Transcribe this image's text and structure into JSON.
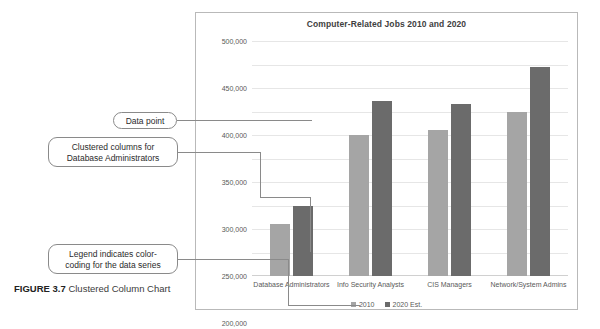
{
  "figure": {
    "caption_label": "FIGURE 3.7",
    "caption_text": "Clustered Column Chart"
  },
  "callouts": [
    {
      "id": "data-point",
      "text": "Data point"
    },
    {
      "id": "clustered-columns",
      "text": "Clustered columns for Database Administrators"
    },
    {
      "id": "legend-note",
      "text": "Legend indicates color-coding for the data series"
    }
  ],
  "colors": {
    "series_2010": "#a5a5a5",
    "series_2020": "#6b6b6b",
    "gridline": "#e6e6e6",
    "frame_border": "#b9b9b9",
    "callout_border": "#8a8a8a",
    "text": "#595959"
  },
  "chart_data": {
    "type": "bar",
    "title": "Computer-Related Jobs 2010 and 2020",
    "xlabel": "",
    "ylabel": "",
    "categories": [
      "Database Administrators",
      "Info Security Analysts",
      "CIS Managers",
      "Network/System Admins"
    ],
    "series": [
      {
        "name": "2010",
        "values": [
          110000,
          300000,
          310000,
          350000
        ]
      },
      {
        "name": "2020 Est.",
        "values": [
          150000,
          372000,
          365000,
          445000
        ]
      }
    ],
    "ylim": [
      0,
      500000
    ],
    "yticks": [
      50000,
      100000,
      150000,
      200000,
      250000,
      300000,
      350000,
      400000,
      450000,
      500000
    ],
    "ytick_labels": [
      "50,000",
      "100,000",
      "150,000",
      "200,000",
      "250,000",
      "300,000",
      "350,000",
      "400,000",
      "450,000",
      "500,000"
    ],
    "grid": true,
    "legend_position": "bottom"
  }
}
